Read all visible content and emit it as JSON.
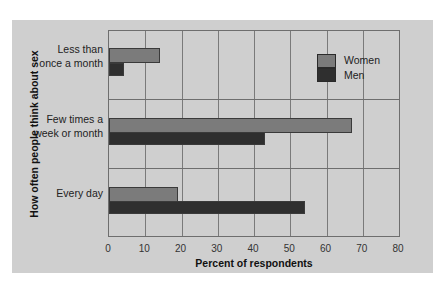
{
  "chart_data": {
    "type": "bar",
    "orientation": "horizontal",
    "title": "",
    "xlabel": "Percent of respondents",
    "ylabel": "How often people think about sex",
    "categories": [
      "Less than once a month",
      "Few times a week or month",
      "Every day"
    ],
    "series": [
      {
        "name": "Women",
        "color": "#7b7b7b",
        "values": [
          14,
          67,
          19
        ]
      },
      {
        "name": "Men",
        "color": "#2f2f2f",
        "values": [
          4,
          43,
          54
        ]
      }
    ],
    "xlim": [
      0,
      80
    ],
    "xticks": [
      0,
      10,
      20,
      30,
      40,
      50,
      60,
      70,
      80
    ],
    "grid": true,
    "legend_position": "upper right inside"
  },
  "labels": {
    "categories": [
      "Less than\nonce a month",
      "Few times a\nweek or month",
      "Every day"
    ],
    "ticks": [
      "0",
      "10",
      "20",
      "30",
      "40",
      "50",
      "60",
      "70",
      "80"
    ],
    "xlabel": "Percent of respondents",
    "ylabel": "How often people think about sex",
    "legend": [
      "Women",
      "Men"
    ]
  }
}
